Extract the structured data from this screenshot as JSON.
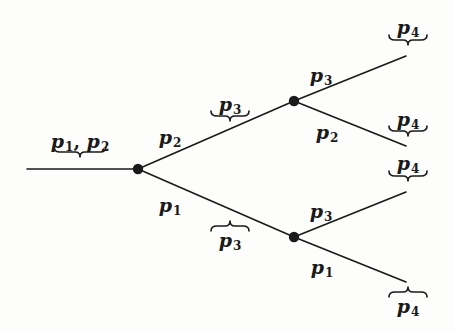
{
  "diagram": {
    "type": "binary-tree",
    "colors": {
      "stroke": "#1a1a1a",
      "node": "#1a1a1a",
      "background": "#fdfdfc"
    },
    "nodes": [
      {
        "id": "root",
        "x": 138,
        "y": 169
      },
      {
        "id": "upper",
        "x": 294,
        "y": 101
      },
      {
        "id": "lower",
        "x": 294,
        "y": 237
      }
    ],
    "edges": [
      {
        "id": "input",
        "from": [
          27,
          169
        ],
        "to": [
          138,
          169
        ]
      },
      {
        "id": "root-upper",
        "from": [
          138,
          169
        ],
        "to": [
          294,
          101
        ],
        "label": {
          "base": "p",
          "sub": "2",
          "x": 170,
          "y": 138
        }
      },
      {
        "id": "root-lower",
        "from": [
          138,
          169
        ],
        "to": [
          294,
          237
        ],
        "label": {
          "base": "p",
          "sub": "1",
          "x": 170,
          "y": 206
        }
      },
      {
        "id": "upper-top",
        "from": [
          294,
          101
        ],
        "to": [
          406,
          56
        ],
        "label": {
          "base": "p",
          "sub": "3",
          "x": 321,
          "y": 76
        }
      },
      {
        "id": "upper-bottom",
        "from": [
          294,
          101
        ],
        "to": [
          406,
          146
        ],
        "label": {
          "base": "p",
          "sub": "2",
          "x": 327,
          "y": 133
        }
      },
      {
        "id": "lower-top",
        "from": [
          294,
          237
        ],
        "to": [
          406,
          192
        ],
        "label": {
          "base": "p",
          "sub": "3",
          "x": 321,
          "y": 212
        }
      },
      {
        "id": "lower-bottom",
        "from": [
          294,
          237
        ],
        "to": [
          406,
          282
        ],
        "label": {
          "base": "p",
          "sub": "1",
          "x": 322,
          "y": 268
        }
      }
    ],
    "braces": [
      {
        "id": "brace-p1p2",
        "kind": "under",
        "cx": 80,
        "y": 152,
        "w": 52,
        "label": {
          "parts": [
            {
              "base": "p",
              "sub": "1"
            },
            {
              "base": "p",
              "sub": "2"
            }
          ],
          "x": 80,
          "y": 142
        }
      },
      {
        "id": "brace-p3-upper",
        "kind": "under",
        "cx": 230,
        "y": 116,
        "w": 38,
        "label": {
          "parts": [
            {
              "base": "p",
              "sub": "3"
            }
          ],
          "x": 230,
          "y": 105
        }
      },
      {
        "id": "brace-p3-lower",
        "kind": "over",
        "cx": 230,
        "y": 226,
        "w": 38,
        "label": {
          "parts": [
            {
              "base": "p",
              "sub": "3"
            }
          ],
          "x": 230,
          "y": 241
        }
      },
      {
        "id": "brace-p4-1",
        "kind": "under",
        "cx": 408,
        "y": 40,
        "w": 38,
        "label": {
          "parts": [
            {
              "base": "p",
              "sub": "4"
            }
          ],
          "x": 408,
          "y": 28
        }
      },
      {
        "id": "brace-p4-2",
        "kind": "under",
        "cx": 408,
        "y": 131,
        "w": 38,
        "label": {
          "parts": [
            {
              "base": "p",
              "sub": "4"
            }
          ],
          "x": 408,
          "y": 120
        }
      },
      {
        "id": "brace-p4-3",
        "kind": "under",
        "cx": 408,
        "y": 176,
        "w": 38,
        "label": {
          "parts": [
            {
              "base": "p",
              "sub": "4"
            }
          ],
          "x": 408,
          "y": 164
        }
      },
      {
        "id": "brace-p4-4",
        "kind": "over",
        "cx": 408,
        "y": 292,
        "w": 38,
        "label": {
          "parts": [
            {
              "base": "p",
              "sub": "4"
            }
          ],
          "x": 408,
          "y": 307
        }
      }
    ]
  }
}
